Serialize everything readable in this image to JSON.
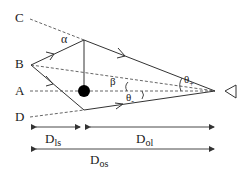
{
  "points": {
    "C": "C",
    "B": "B",
    "A": "A",
    "D": "D"
  },
  "angles": {
    "alpha": "α",
    "beta": "β",
    "theta_plus_base": "θ",
    "theta_plus_sub": "+",
    "theta_minus_base": "θ",
    "theta_minus_sub": "-"
  },
  "distances": {
    "dls_base": "D",
    "dls_sub": "ls",
    "dol_base": "D",
    "dol_sub": "ol",
    "dos_base": "D",
    "dos_sub": "os"
  },
  "colors": {
    "line": "#333333",
    "dash": "#555555",
    "lens": "#000000"
  }
}
